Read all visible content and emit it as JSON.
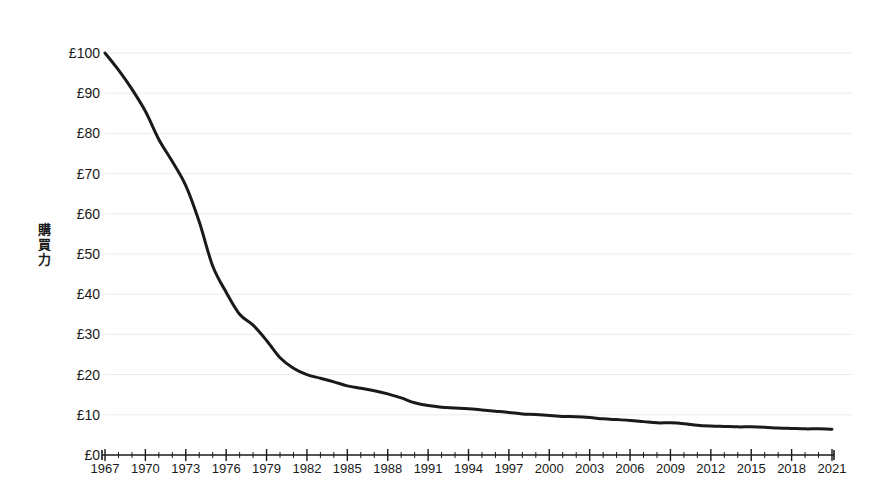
{
  "chart_data": {
    "type": "line",
    "title": "",
    "subtitle": "",
    "xlabel": "",
    "ylabel": "購買力",
    "ylabel_chars": [
      "購",
      "買",
      "力"
    ],
    "xlim": [
      1967,
      2021
    ],
    "ylim": [
      0,
      100
    ],
    "grid": true,
    "legend": null,
    "y_tick_labels": [
      "£100",
      "£90",
      "£80",
      "£70",
      "£60",
      "£50",
      "£40",
      "£30",
      "£20",
      "£10",
      "£0"
    ],
    "y_tick_values": [
      100,
      90,
      80,
      70,
      60,
      50,
      40,
      30,
      20,
      10,
      0
    ],
    "x_tick_labels": [
      "1967",
      "1970",
      "1973",
      "1976",
      "1979",
      "1982",
      "1985",
      "1988",
      "1991",
      "1994",
      "1997",
      "2000",
      "2003",
      "2006",
      "2009",
      "2012",
      "2015",
      "2018",
      "2021"
    ],
    "x_tick_values": [
      1967,
      1970,
      1973,
      1976,
      1979,
      1982,
      1985,
      1988,
      1991,
      1994,
      1997,
      2000,
      2003,
      2006,
      2009,
      2012,
      2015,
      2018,
      2021
    ],
    "x_minor_tick_interval": 1,
    "x_major_tick_interval": 3,
    "series": [
      {
        "name": "購買力",
        "color": "#1a1a1a",
        "line_width": 3,
        "x": [
          1967,
          1968,
          1969,
          1970,
          1971,
          1972,
          1973,
          1974,
          1975,
          1976,
          1977,
          1978,
          1979,
          1980,
          1981,
          1982,
          1983,
          1984,
          1985,
          1986,
          1987,
          1988,
          1989,
          1990,
          1991,
          1992,
          1993,
          1994,
          1995,
          1996,
          1997,
          1998,
          1999,
          2000,
          2001,
          2002,
          2003,
          2004,
          2005,
          2006,
          2007,
          2008,
          2009,
          2010,
          2011,
          2012,
          2013,
          2014,
          2015,
          2016,
          2017,
          2018,
          2019,
          2020,
          2021
        ],
        "y": [
          100.0,
          95.8,
          91.0,
          85.5,
          78.5,
          73.0,
          67.0,
          58.0,
          47.0,
          40.5,
          35.0,
          32.3,
          28.5,
          24.2,
          21.6,
          20.0,
          19.1,
          18.2,
          17.2,
          16.6,
          16.0,
          15.2,
          14.2,
          13.0,
          12.3,
          11.9,
          11.7,
          11.5,
          11.2,
          10.9,
          10.6,
          10.2,
          10.1,
          9.8,
          9.6,
          9.5,
          9.3,
          9.0,
          8.8,
          8.6,
          8.3,
          8.0,
          8.0,
          7.8,
          7.4,
          7.2,
          7.1,
          7.0,
          7.0,
          6.9,
          6.7,
          6.6,
          6.5,
          6.5,
          6.4
        ]
      }
    ],
    "axis_color": "#1a1a1a",
    "grid_color": "#ececec",
    "background_color": "#ffffff"
  }
}
